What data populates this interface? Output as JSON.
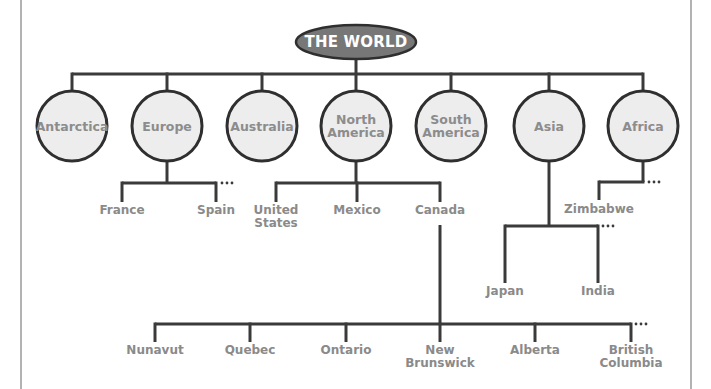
{
  "diagram": {
    "root": {
      "label": "THE WORLD",
      "x": 356,
      "y": 42,
      "rx": 60,
      "ry": 17,
      "fill": "#777777"
    },
    "colors": {
      "line": "#3a3a3a",
      "node_fill": "#ededed",
      "label": "#8a8a8a",
      "root_text": "#ffffff",
      "frame": "#9a9a9a"
    },
    "continents": [
      {
        "id": "antarctica",
        "label": "Antarctica",
        "x": 72,
        "y": 126
      },
      {
        "id": "europe",
        "label": "Europe",
        "x": 167,
        "y": 126
      },
      {
        "id": "australia",
        "label": "Australia",
        "x": 262,
        "y": 126
      },
      {
        "id": "north-america",
        "label": "North\nAmerica",
        "x": 356,
        "y": 126
      },
      {
        "id": "south-america",
        "label": "South\nAmerica",
        "x": 451,
        "y": 126
      },
      {
        "id": "asia",
        "label": "Asia",
        "x": 549,
        "y": 126
      },
      {
        "id": "africa",
        "label": "Africa",
        "x": 643,
        "y": 126
      }
    ],
    "europe_children": [
      {
        "label": "France",
        "x": 122
      },
      {
        "label": "Spain",
        "x": 216
      }
    ],
    "north_america_children": [
      {
        "label": "United States",
        "line1": "United",
        "line2": "States",
        "x": 276
      },
      {
        "label": "Mexico",
        "x": 357
      },
      {
        "label": "Canada",
        "x": 440
      }
    ],
    "africa_children": [
      {
        "label": "Zimbabwe",
        "x": 599
      }
    ],
    "asia_children": [
      {
        "label": "Japan",
        "x": 505
      },
      {
        "label": "India",
        "x": 598
      }
    ],
    "canada_children": [
      {
        "label": "Nunavut",
        "x": 155
      },
      {
        "label": "Quebec",
        "x": 250
      },
      {
        "label": "Ontario",
        "x": 346
      },
      {
        "label": "New Brunswick",
        "line1": "New",
        "line2": "Brunswick",
        "x": 440
      },
      {
        "label": "Alberta",
        "x": 535
      },
      {
        "label": "British Columbia",
        "line1": "British",
        "line2": "Columbia",
        "x": 631
      }
    ],
    "continuation_marker": "..."
  }
}
